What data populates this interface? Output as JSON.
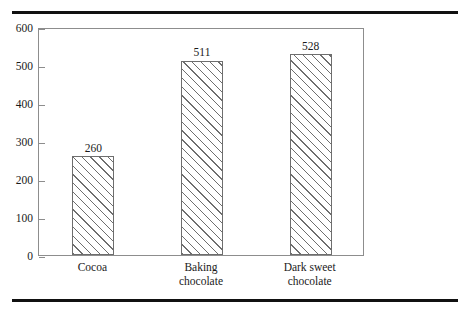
{
  "figure": {
    "background_color": "#ffffff",
    "rule_color": "#111111",
    "frame_color": "#8d8d8d",
    "bar_outline_color": "#6e6e6e",
    "hatch": "diagonal-forward-slash"
  },
  "chart_data": {
    "type": "bar",
    "title": "",
    "subtitle": "",
    "xlabel": "",
    "ylabel": "",
    "categories": [
      "Cocoa",
      "Baking chocolate",
      "Dark sweet chocolate"
    ],
    "category_lines": [
      [
        "Cocoa"
      ],
      [
        "Baking",
        "chocolate"
      ],
      [
        "Dark sweet",
        "chocolate"
      ]
    ],
    "values": [
      260,
      511,
      528
    ],
    "value_labels": [
      "260",
      "511",
      "528"
    ],
    "ylim": [
      0,
      600
    ],
    "yticks": [
      0,
      100,
      200,
      300,
      400,
      500,
      600
    ],
    "ytick_labels": [
      "0",
      "100",
      "200",
      "300",
      "400",
      "500",
      "600"
    ],
    "xticks_visible": false,
    "grid": false,
    "legend": null,
    "legend_position": "none",
    "annotations": []
  }
}
